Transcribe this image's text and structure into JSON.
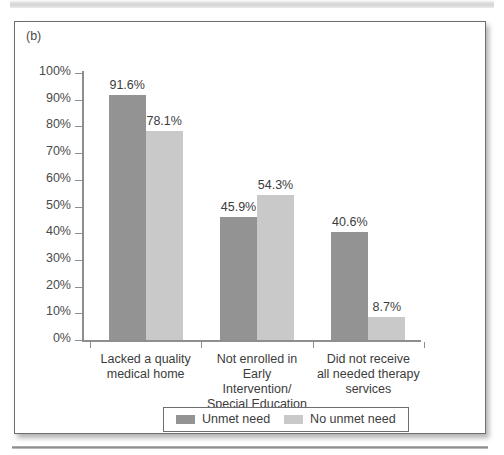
{
  "figure": {
    "panel_label": "(b)"
  },
  "chart_data": {
    "type": "bar",
    "title": "",
    "subtitle": "",
    "xlabel": "",
    "ylabel": "",
    "ylim": [
      0,
      100
    ],
    "grid": false,
    "legend_position": "bottom-center",
    "axis_tick_suffix": "%",
    "categories": [
      "Lacked a quality\nmedical home",
      "Not enrolled in Early\nIntervention/\nSpecial Education",
      "Did not receive\nall needed therapy\nservices"
    ],
    "ytick_labels": [
      "100%",
      "90%",
      "80%",
      "70%",
      "60%",
      "50%",
      "40%",
      "30%",
      "20%",
      "10%",
      "0%"
    ],
    "ytick_values": [
      100,
      90,
      80,
      70,
      60,
      50,
      40,
      30,
      20,
      10,
      0
    ],
    "series": [
      {
        "name": "Unmet need",
        "color": "#939393",
        "values": [
          91.6,
          45.9,
          40.6
        ],
        "labels": [
          "91.6%",
          "45.9%",
          "40.6%"
        ]
      },
      {
        "name": "No unmet need",
        "color": "#c9c9c9",
        "values": [
          78.1,
          54.3,
          8.7
        ],
        "labels": [
          "78.1%",
          "54.3%",
          "8.7%"
        ]
      }
    ]
  },
  "legend": {
    "entries": [
      {
        "label": "Unmet need",
        "color": "#939393"
      },
      {
        "label": "No unmet need",
        "color": "#c9c9c9"
      }
    ]
  }
}
